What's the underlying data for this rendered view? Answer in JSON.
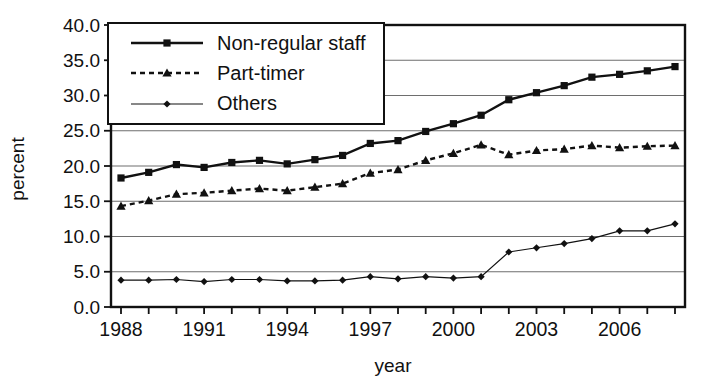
{
  "chart_data": {
    "type": "line",
    "title": "",
    "xlabel": "year",
    "ylabel": "percent",
    "x": [
      1988,
      1989,
      1990,
      1991,
      1992,
      1993,
      1994,
      1995,
      1996,
      1997,
      1998,
      1999,
      2000,
      2001,
      2002,
      2003,
      2004,
      2005,
      2006,
      2007,
      2008
    ],
    "x_tick_label_years": [
      1988,
      1991,
      1994,
      1997,
      2000,
      2003,
      2006
    ],
    "y_ticks": [
      0,
      5,
      10,
      15,
      20,
      25,
      30,
      35,
      40
    ],
    "y_tick_labels": [
      "0.0",
      "5.0",
      "10.0",
      "15.0",
      "20.0",
      "25.0",
      "30.0",
      "35.0",
      "40.0"
    ],
    "ylim": [
      0,
      40
    ],
    "grid": "horizontal",
    "legend_position": "top-left-inside",
    "series": [
      {
        "name": "Non-regular staff",
        "line": "solid-thick",
        "marker": "square",
        "values": [
          18.3,
          19.1,
          20.2,
          19.8,
          20.5,
          20.8,
          20.3,
          20.9,
          21.5,
          23.2,
          23.6,
          24.9,
          26.0,
          27.2,
          29.4,
          30.4,
          31.4,
          32.6,
          33.0,
          33.5,
          34.1
        ]
      },
      {
        "name": "Part-timer",
        "line": "dashed",
        "marker": "triangle",
        "values": [
          14.3,
          15.1,
          16.0,
          16.2,
          16.5,
          16.8,
          16.5,
          17.0,
          17.5,
          19.0,
          19.5,
          20.8,
          21.8,
          23.0,
          21.6,
          22.2,
          22.4,
          22.9,
          22.6,
          22.8,
          22.9
        ]
      },
      {
        "name": "Others",
        "line": "solid-thin",
        "marker": "diamond",
        "values": [
          3.8,
          3.8,
          3.9,
          3.6,
          3.9,
          3.9,
          3.7,
          3.7,
          3.8,
          4.3,
          4.0,
          4.3,
          4.1,
          4.3,
          7.8,
          8.4,
          9.0,
          9.7,
          10.8,
          10.8,
          11.8
        ]
      }
    ],
    "colors": {
      "line": "#111111",
      "grid": "#6e6e6e",
      "background": "#ffffff"
    }
  }
}
